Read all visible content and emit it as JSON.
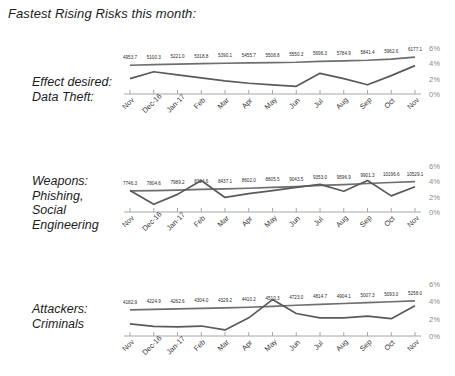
{
  "title": "Fastest Rising Risks this month:",
  "axis": {
    "categories": [
      "Nov",
      "Dec-16",
      "Jan-17",
      "Feb",
      "Mar",
      "Apr",
      "May",
      "Jun",
      "Jul",
      "Aug",
      "Sep",
      "Oct",
      "Nov"
    ],
    "yticks": [
      "6%",
      "4%",
      "2%",
      "0%"
    ],
    "ylim": [
      0,
      6
    ]
  },
  "panels": [
    {
      "label_lines": [
        "Effect desired:",
        "Data Theft:"
      ],
      "chart_data": {
        "type": "line",
        "title": "Effect desired: Data Theft",
        "xlabel": "",
        "ylabel": "",
        "ylim": [
          0,
          6
        ],
        "grid": false,
        "legend": "none",
        "categories": [
          "Nov",
          "Dec-16",
          "Jan-17",
          "Feb",
          "Mar",
          "Apr",
          "May",
          "Jun",
          "Jul",
          "Aug",
          "Sep",
          "Oct",
          "Nov"
        ],
        "series": [
          {
            "name": "Volume",
            "labelled": true,
            "values": [
              4953.7,
              5100.3,
              5221.0,
              5318.8,
              5390.1,
              5455.7,
              5508.8,
              5550.3,
              5696.3,
              5784.9,
              5841.4,
              5962.6,
              6177.1
            ],
            "plot_percent": [
              3.75,
              3.83,
              3.9,
              3.96,
              4.01,
              4.06,
              4.1,
              4.14,
              4.26,
              4.33,
              4.4,
              4.55,
              4.8
            ]
          },
          {
            "name": "Percent of risk",
            "labelled": false,
            "values": [
              2.0,
              2.9,
              2.5,
              2.1,
              1.7,
              1.4,
              1.2,
              1.0,
              2.7,
              2.0,
              1.2,
              2.4,
              3.7
            ]
          }
        ]
      }
    },
    {
      "label_lines": [
        "Weapons:",
        "Phishing,",
        "Social",
        "Engineering"
      ],
      "chart_data": {
        "type": "line",
        "title": "Weapons: Phishing, Social Engineering",
        "xlabel": "",
        "ylabel": "",
        "ylim": [
          0,
          6
        ],
        "grid": false,
        "legend": "none",
        "categories": [
          "Nov",
          "Dec-16",
          "Jan-17",
          "Feb",
          "Mar",
          "Apr",
          "May",
          "Jun",
          "Jul",
          "Aug",
          "Sep",
          "Oct",
          "Nov"
        ],
        "series": [
          {
            "name": "Volume",
            "labelled": true,
            "values": [
              7746.3,
              7804.6,
              7989.2,
              8304.6,
              8437.1,
              8602.0,
              8805.5,
              9043.5,
              9353.0,
              9596.9,
              9901.3,
              10196.6,
              10529.1
            ],
            "plot_percent": [
              2.75,
              2.8,
              2.85,
              2.95,
              3.02,
              3.1,
              3.2,
              3.32,
              3.46,
              3.58,
              3.72,
              3.85,
              3.97
            ]
          },
          {
            "name": "Percent of risk",
            "labelled": false,
            "values": [
              2.8,
              1.0,
              2.3,
              4.1,
              1.9,
              2.4,
              2.8,
              3.2,
              3.6,
              2.7,
              4.1,
              2.1,
              3.3
            ]
          }
        ]
      }
    },
    {
      "label_lines": [
        "Attackers:",
        "Criminals"
      ],
      "chart_data": {
        "type": "line",
        "title": "Attackers: Criminals",
        "xlabel": "",
        "ylabel": "",
        "ylim": [
          0,
          6
        ],
        "grid": false,
        "legend": "none",
        "categories": [
          "Nov",
          "Dec-16",
          "Jan-17",
          "Feb",
          "Mar",
          "Apr",
          "May",
          "Jun",
          "Jul",
          "Aug",
          "Sep",
          "Oct",
          "Nov"
        ],
        "series": [
          {
            "name": "Volume",
            "labelled": true,
            "values": [
              4182.9,
              4224.9,
              4262.6,
              4304.0,
              4329.2,
              4410.2,
              4510.3,
              4723.0,
              4814.7,
              4904.1,
              5007.3,
              5093.0,
              5258.0
            ],
            "plot_percent": [
              3.02,
              3.07,
              3.12,
              3.18,
              3.24,
              3.32,
              3.42,
              3.55,
              3.65,
              3.75,
              3.85,
              3.95,
              4.05
            ]
          },
          {
            "name": "Percent of risk",
            "labelled": false,
            "values": [
              1.4,
              1.1,
              1.05,
              1.15,
              0.7,
              2.1,
              4.2,
              2.6,
              2.1,
              2.1,
              2.3,
              2.0,
              3.5
            ]
          }
        ]
      }
    }
  ]
}
